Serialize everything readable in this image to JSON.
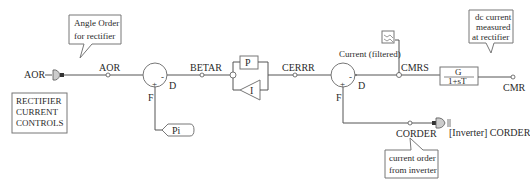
{
  "diagram": {
    "title_box": [
      "RECTIFIER",
      "CURRENT",
      "CONTROLS"
    ],
    "callouts": {
      "angle_order": [
        "Angle Order",
        "for rectifier"
      ],
      "dc_current": [
        "dc current",
        "measured",
        "at rectifier"
      ],
      "current_order": [
        "current  order",
        "from inverter"
      ]
    },
    "signals": {
      "aor_input": "AOR",
      "aor": "AOR",
      "betar": "BETAR",
      "cerrr": "CERRR",
      "cmrs": "CMRS",
      "cmr": "CMR",
      "corder": "CORDER",
      "inverter_corder": "[Inverter] CORDER",
      "current_filtered": "Current (filtered)"
    },
    "blocks": {
      "pi_const": "Pi",
      "p_gain": "P",
      "i_gain": "I",
      "tf_num": "G",
      "tf_den": "1+sT"
    },
    "summer_labels": {
      "s1_d": "D",
      "s1_f": "F",
      "s2_d": "D",
      "s2_f": "F"
    },
    "signs": {
      "plus": "+",
      "minus": "-"
    }
  }
}
